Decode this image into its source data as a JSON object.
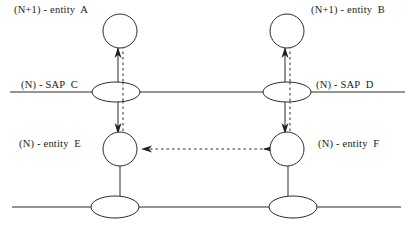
{
  "diagram": {
    "stroke_color": "#2b2b2b",
    "background": "#ffffff",
    "labels": {
      "entity_a": "(N+1) - entity  A",
      "entity_b": "(N+1) - entity  B",
      "sap_c": "(N) - SAP  C",
      "sap_d": "(N) - SAP  D",
      "entity_e": "(N) - entity  E",
      "entity_f": "(N) - entity  F"
    },
    "nodes": [
      {
        "name": "entity-a-circle",
        "shape": "circle",
        "cx": 120,
        "cy": 31,
        "r": 17
      },
      {
        "name": "entity-b-circle",
        "shape": "circle",
        "cx": 287,
        "cy": 31,
        "r": 17
      },
      {
        "name": "sap-c-ellipse",
        "shape": "ellipse",
        "cx": 116,
        "cy": 92,
        "rx": 24,
        "ry": 10
      },
      {
        "name": "sap-d-ellipse",
        "shape": "ellipse",
        "cx": 287,
        "cy": 92,
        "rx": 24,
        "ry": 10
      },
      {
        "name": "entity-e-circle",
        "shape": "circle",
        "cx": 120,
        "cy": 149,
        "r": 17
      },
      {
        "name": "entity-f-circle",
        "shape": "circle",
        "cx": 287,
        "cy": 149,
        "r": 17
      },
      {
        "name": "lower-sap-left-ellipse",
        "shape": "ellipse",
        "cx": 115,
        "cy": 207,
        "rx": 24,
        "ry": 11
      },
      {
        "name": "lower-sap-right-ellipse",
        "shape": "ellipse",
        "cx": 293,
        "cy": 207,
        "rx": 24,
        "ry": 11
      }
    ],
    "layer_lines": [
      {
        "name": "layer-boundary-upper",
        "x1": 10,
        "y1": 92,
        "x2": 405,
        "y2": 92
      },
      {
        "name": "layer-boundary-lower",
        "x1": 12,
        "y1": 207,
        "x2": 401,
        "y2": 207
      }
    ],
    "connectors": [
      {
        "name": "connector-a-to-sapc",
        "style": "solid",
        "from": [
          118,
          48
        ],
        "to": [
          118,
          83
        ],
        "arrow": "up"
      },
      {
        "name": "connector-sapc-to-e",
        "style": "solid",
        "from": [
          118,
          101
        ],
        "to": [
          118,
          132
        ],
        "arrow": "down"
      },
      {
        "name": "connector-b-to-sapd",
        "style": "solid",
        "from": [
          285,
          48
        ],
        "to": [
          285,
          83
        ],
        "arrow": "up"
      },
      {
        "name": "connector-sapd-to-f",
        "style": "solid",
        "from": [
          285,
          101
        ],
        "to": [
          285,
          132
        ],
        "arrow": "down"
      },
      {
        "name": "connector-e-to-lower-sap",
        "style": "solid",
        "from": [
          120,
          166
        ],
        "to": [
          120,
          197
        ],
        "arrow": "none"
      },
      {
        "name": "connector-f-to-lower-sap",
        "style": "solid",
        "from": [
          288,
          166
        ],
        "to": [
          288,
          197
        ],
        "arrow": "none"
      },
      {
        "name": "dataflow-a-vertical",
        "style": "dashed",
        "from": [
          123,
          46
        ],
        "to": [
          123,
          137
        ],
        "arrow": "none"
      },
      {
        "name": "dataflow-b-vertical",
        "style": "dashed",
        "from": [
          290,
          46
        ],
        "to": [
          290,
          137
        ],
        "arrow": "none"
      },
      {
        "name": "dataflow-f-to-e",
        "style": "dashed",
        "from": [
          270,
          149
        ],
        "to": [
          140,
          149
        ],
        "arrow": "both-left"
      }
    ]
  }
}
